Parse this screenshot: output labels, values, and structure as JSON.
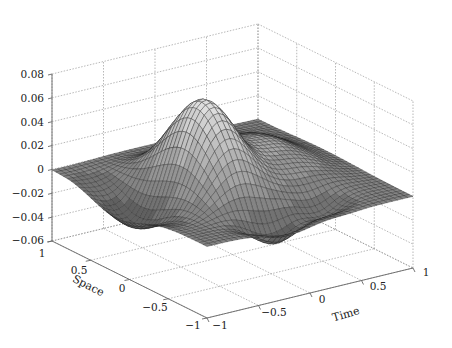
{
  "chart_data": {
    "type": "surface3d",
    "title": "",
    "xlabel": "Time",
    "ylabel": "Space",
    "zlabel": "",
    "x_ticks": [
      "-1",
      "-0.5",
      "0",
      "0.5",
      "1"
    ],
    "y_ticks": [
      "1",
      "0.5",
      "0",
      "-0.5",
      "-1"
    ],
    "z_ticks": [
      "0.08",
      "0.06",
      "0.04",
      "0.02",
      "0",
      "-0.02",
      "-0.04",
      "-0.06"
    ],
    "xlim": [
      -1,
      1
    ],
    "ylim": [
      -1,
      1
    ],
    "zlim": [
      -0.06,
      0.08
    ],
    "grid": true,
    "colormap": "gray",
    "surface_description": "Mesh surface over Space x Time in [-1,1]^2; central peak near Time=-0.3, Space=0 reaching ~0.075; troughs ~-0.06 near front edges; surface near 0 at corners",
    "peak": {
      "time": -0.3,
      "space": 0.0,
      "value": 0.075
    },
    "trough": {
      "value": -0.06
    }
  },
  "axes": {
    "z_tick_labels": [
      "0.08",
      "0.06",
      "0.04",
      "0.02",
      "0",
      "−0.02",
      "−0.04",
      "−0.06"
    ],
    "space_tick_labels": [
      "1",
      "0.5",
      "0",
      "−0.5",
      "−1"
    ],
    "time_tick_labels": [
      "−1",
      "−0.5",
      "0",
      "0.5",
      "1"
    ],
    "space_label": "Space",
    "time_label": "Time"
  }
}
